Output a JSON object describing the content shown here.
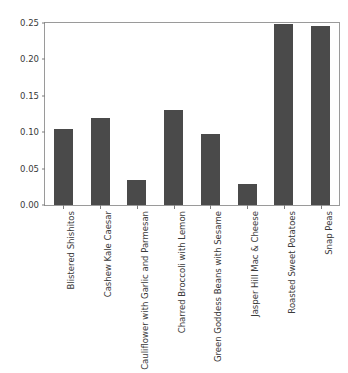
{
  "chart_data": {
    "type": "bar",
    "title": "",
    "subtitle": "",
    "xlabel": "",
    "ylabel": "",
    "ylim": [
      0.0,
      0.25
    ],
    "yticks": [
      "0.00",
      "0.05",
      "0.10",
      "0.15",
      "0.20",
      "0.25"
    ],
    "ytick_values": [
      0.0,
      0.05,
      0.1,
      0.15,
      0.2,
      0.25
    ],
    "grid": false,
    "legend": null,
    "legend_position": "none",
    "bar_color": "#4a4a4a",
    "axes_color": "#9a9a9a",
    "tick_label_rotation": -90,
    "categories": [
      "Blistered Shishitos",
      "Cashew Kale Caesar",
      "Cauliflower with Garlic and Parmesan",
      "Charred Broccoli with Lemon",
      "Green Goddess Beans with Sesame",
      "Jasper Hill Mac & Cheese",
      "Roasted Sweet Potatoes",
      "Snap Peas"
    ],
    "values": [
      0.104,
      0.12,
      0.035,
      0.13,
      0.097,
      0.029,
      0.248,
      0.246
    ]
  }
}
